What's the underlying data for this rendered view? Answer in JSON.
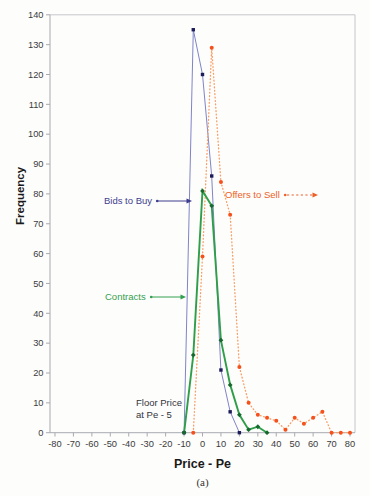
{
  "figure": {
    "caption": "(a)"
  },
  "chart_data": {
    "type": "line",
    "title": "",
    "xlabel": "Price - Pe",
    "ylabel": "Frequency",
    "xlim": [
      -82.5,
      82.5
    ],
    "ylim": [
      0,
      140
    ],
    "grid": false,
    "legend_position": "in-plot arrow annotations",
    "x_ticks": [
      -80,
      -70,
      -60,
      -50,
      -40,
      -30,
      -20,
      -10,
      0,
      10,
      20,
      30,
      40,
      50,
      60,
      70,
      80
    ],
    "y_ticks": [
      0,
      10,
      20,
      30,
      40,
      50,
      60,
      70,
      80,
      90,
      100,
      110,
      120,
      130,
      140
    ],
    "series": [
      {
        "name": "Bids to Buy",
        "style": "solid",
        "marker": "square",
        "line_color": "#8084c8",
        "marker_color": "#1c1c5a",
        "label_color": "#3d3d8f",
        "points": [
          [
            -10,
            0
          ],
          [
            -5,
            135
          ],
          [
            0,
            120
          ],
          [
            5,
            86
          ],
          [
            10,
            21
          ],
          [
            15,
            7
          ],
          [
            20,
            0
          ]
        ]
      },
      {
        "name": "Offers to Sell",
        "style": "dotted",
        "marker": "circle",
        "line_color": "#f99d66",
        "marker_color": "#f4511c",
        "label_color": "#ee5f28",
        "points": [
          [
            -5,
            0
          ],
          [
            0,
            59
          ],
          [
            5,
            129
          ],
          [
            10,
            84
          ],
          [
            15,
            73
          ],
          [
            20,
            22
          ],
          [
            25,
            10
          ],
          [
            30,
            6
          ],
          [
            35,
            5
          ],
          [
            40,
            4
          ],
          [
            45,
            1
          ],
          [
            50,
            5
          ],
          [
            55,
            3
          ],
          [
            60,
            5
          ],
          [
            65,
            7
          ],
          [
            70,
            0
          ],
          [
            75,
            0
          ],
          [
            80,
            0
          ]
        ]
      },
      {
        "name": "Contracts",
        "style": "solid",
        "marker": "diamond",
        "line_color": "#2f9e4a",
        "marker_color": "#15692c",
        "label_color": "#35a050",
        "points": [
          [
            -10,
            0
          ],
          [
            -5,
            26
          ],
          [
            0,
            81
          ],
          [
            5,
            76
          ],
          [
            10,
            31
          ],
          [
            15,
            16
          ],
          [
            20,
            6
          ],
          [
            25,
            1
          ],
          [
            30,
            2
          ],
          [
            35,
            0
          ]
        ]
      }
    ],
    "annotation_floor": {
      "line1": "Floor Price",
      "line2": "at Pe - 5"
    },
    "axis_colors": {
      "axis": "#a9a9b2",
      "plot_border": "#c6c6ce",
      "tick_label": "#3b3b3b"
    }
  }
}
